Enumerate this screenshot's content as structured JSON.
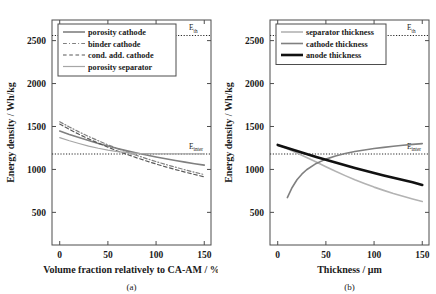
{
  "figure": {
    "background": "#ffffff",
    "axis_color": "#4d4d4d",
    "panels": [
      "a",
      "b"
    ]
  },
  "panel_a": {
    "caption": "(a)",
    "xlabel": "Volume fraction relatively to CA-AM / %",
    "ylabel": "Energy density / Wh/kg",
    "xticks": [
      "0",
      "50",
      "100",
      "150"
    ],
    "yticks": [
      "500",
      "1000",
      "1500",
      "2000",
      "2500"
    ],
    "legend": [
      {
        "label": "porosity cathode",
        "color": "#808080",
        "style": "solid",
        "width": 1.6
      },
      {
        "label": "binder cathode",
        "color": "#808080",
        "style": "dashdot",
        "width": 1.2
      },
      {
        "label": "cond. add. cathode",
        "color": "#595959",
        "style": "dashed",
        "width": 1.2
      },
      {
        "label": "porosity separator",
        "color": "#a6a6a6",
        "style": "solid",
        "width": 1.2
      }
    ],
    "annotations": [
      {
        "name": "E_th",
        "base": "E",
        "sub": "th",
        "value": 2560
      },
      {
        "name": "E_inter",
        "base": "E",
        "sub": "inter",
        "value": 1180
      }
    ]
  },
  "panel_b": {
    "caption": "(b)",
    "xlabel": "Thickness / μm",
    "ylabel": "Energy density / Wh/kg",
    "xticks": [
      "0",
      "50",
      "100",
      "150"
    ],
    "yticks": [
      "500",
      "1000",
      "1500",
      "2000",
      "2500"
    ],
    "legend": [
      {
        "label": "separator thickness",
        "color": "#b3b3b3",
        "style": "solid",
        "width": 1.6
      },
      {
        "label": "cathode thickness",
        "color": "#808080",
        "style": "solid",
        "width": 1.6
      },
      {
        "label": "anode thickness",
        "color": "#111111",
        "style": "solid",
        "width": 2.6
      }
    ],
    "annotations": [
      {
        "name": "E_th",
        "base": "E",
        "sub": "th",
        "value": 2560
      },
      {
        "name": "E_inter",
        "base": "E",
        "sub": "inter",
        "value": 1180
      }
    ]
  },
  "chart_data": [
    {
      "type": "line",
      "panel": "(a)",
      "title": "",
      "xlabel": "Volume fraction relatively to CA-AM / %",
      "ylabel": "Energy density / Wh/kg",
      "xlim": [
        -8,
        157
      ],
      "ylim": [
        120,
        2740
      ],
      "xticks": [
        0,
        50,
        100,
        150
      ],
      "yticks": [
        500,
        1000,
        1500,
        2000,
        2500
      ],
      "grid": false,
      "legend_position": "upper-left",
      "reference_lines": [
        {
          "label": "E_th",
          "y": 2560,
          "style": "dotted"
        },
        {
          "label": "E_inter",
          "y": 1180,
          "style": "dotted"
        }
      ],
      "x": [
        0,
        10,
        20,
        30,
        40,
        50,
        60,
        70,
        80,
        90,
        100,
        110,
        120,
        130,
        140,
        150
      ],
      "series": [
        {
          "name": "porosity cathode",
          "color": "#808080",
          "style": "solid",
          "values": [
            1448,
            1408,
            1371,
            1336,
            1303,
            1272,
            1243,
            1216,
            1191,
            1167,
            1145,
            1124,
            1104,
            1085,
            1067,
            1050
          ]
        },
        {
          "name": "binder cathode",
          "color": "#808080",
          "style": "dashdot",
          "values": [
            1555,
            1494,
            1437,
            1384,
            1334,
            1287,
            1243,
            1202,
            1163,
            1126,
            1091,
            1058,
            1026,
            996,
            967,
            940
          ]
        },
        {
          "name": "cond. add. cathode",
          "color": "#595959",
          "style": "dashed",
          "values": [
            1528,
            1466,
            1409,
            1356,
            1306,
            1259,
            1215,
            1174,
            1135,
            1098,
            1063,
            1030,
            999,
            969,
            941,
            914
          ]
        },
        {
          "name": "porosity separator",
          "color": "#a6a6a6",
          "style": "solid",
          "values": [
            1370,
            1334,
            1302,
            1272,
            1247,
            1225,
            1208,
            1195,
            1187,
            1183,
            1181,
            1180,
            1180,
            1180,
            1180,
            1180
          ]
        }
      ]
    },
    {
      "type": "line",
      "panel": "(b)",
      "title": "",
      "xlabel": "Thickness / μm",
      "ylabel": "Energy density / Wh/kg",
      "xlim": [
        -8,
        157
      ],
      "ylim": [
        120,
        2740
      ],
      "xticks": [
        0,
        50,
        100,
        150
      ],
      "yticks": [
        500,
        1000,
        1500,
        2000,
        2500
      ],
      "grid": false,
      "legend_position": "upper-left",
      "reference_lines": [
        {
          "label": "E_th",
          "y": 2560,
          "style": "dotted"
        },
        {
          "label": "E_inter",
          "y": 1180,
          "style": "dotted"
        }
      ],
      "x": [
        0,
        10,
        20,
        30,
        40,
        50,
        60,
        70,
        80,
        90,
        100,
        110,
        120,
        130,
        140,
        150
      ],
      "series": [
        {
          "name": "separator thickness",
          "color": "#b3b3b3",
          "style": "solid",
          "values": [
            1285,
            1240,
            1192,
            1140,
            1086,
            1032,
            978,
            928,
            880,
            836,
            794,
            756,
            720,
            687,
            656,
            627
          ]
        },
        {
          "name": "cathode thickness",
          "color": "#808080",
          "style": "solid",
          "x": [
            10,
            15,
            20,
            25,
            30,
            40,
            50,
            60,
            70,
            80,
            90,
            100,
            110,
            120,
            130,
            140,
            150
          ],
          "values": [
            672,
            790,
            880,
            945,
            996,
            1070,
            1120,
            1157,
            1185,
            1208,
            1227,
            1243,
            1257,
            1270,
            1282,
            1292,
            1300
          ]
        },
        {
          "name": "anode thickness",
          "color": "#111111",
          "style": "solid",
          "values": [
            1285,
            1250,
            1215,
            1180,
            1146,
            1113,
            1080,
            1048,
            1017,
            987,
            958,
            930,
            902,
            876,
            850,
            820
          ]
        }
      ]
    }
  ]
}
